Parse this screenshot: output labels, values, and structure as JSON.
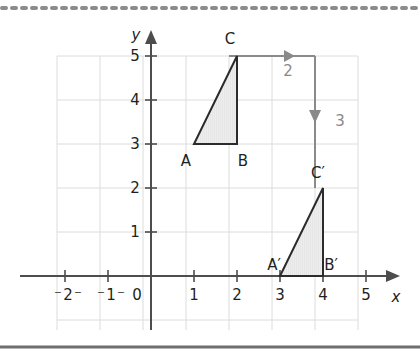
{
  "figure": {
    "background_color": "#ffffff",
    "top_rule": {
      "style": "dotted",
      "color": "#8c8c8c"
    },
    "bottom_rule": {
      "style": "solid",
      "color": "#6e6e6e"
    }
  },
  "axes": {
    "x_label": "x",
    "y_label": "y",
    "origin_label": "0",
    "x_ticks": [
      {
        "value": -2,
        "label": "2",
        "negative": true
      },
      {
        "value": -1,
        "label": "1",
        "negative": true
      },
      {
        "value": 1,
        "label": "1",
        "negative": false
      },
      {
        "value": 2,
        "label": "2",
        "negative": false
      },
      {
        "value": 3,
        "label": "3",
        "negative": false
      },
      {
        "value": 4,
        "label": "4",
        "negative": false
      },
      {
        "value": 5,
        "label": "5",
        "negative": false
      }
    ],
    "y_ticks": [
      {
        "value": 1,
        "label": "1"
      },
      {
        "value": 2,
        "label": "2"
      },
      {
        "value": 3,
        "label": "3"
      },
      {
        "value": 4,
        "label": "4"
      },
      {
        "value": 5,
        "label": "5"
      }
    ],
    "x_range": [
      -2,
      5
    ],
    "y_range": [
      -1,
      5
    ],
    "grid": true,
    "grid_color": "#d8d8d8",
    "axis_color": "#4d4d4d"
  },
  "shapes": {
    "preimage": {
      "name": "triangle-abc",
      "fill": "#ebebeb",
      "stroke": "#2b2b2b",
      "vertices": [
        {
          "label": "A",
          "x": 1,
          "y": 3
        },
        {
          "label": "B",
          "x": 2,
          "y": 3
        },
        {
          "label": "C",
          "x": 2,
          "y": 5
        }
      ]
    },
    "image": {
      "name": "triangle-a-prime-b-prime-c-prime",
      "fill": "#ebebeb",
      "stroke": "#2b2b2b",
      "vertices": [
        {
          "label": "A′",
          "x": 3,
          "y": 0
        },
        {
          "label": "B′",
          "x": 4,
          "y": 0
        },
        {
          "label": "C′",
          "x": 4,
          "y": 2
        }
      ]
    }
  },
  "translation": {
    "color": "#8a8a8a",
    "steps": [
      {
        "name": "horizontal-right",
        "label": "2",
        "from": {
          "x": 2,
          "y": 5
        },
        "to": {
          "x": 4,
          "y": 5
        },
        "direction": "right"
      },
      {
        "name": "vertical-down",
        "label": "3",
        "from": {
          "x": 4,
          "y": 5
        },
        "to": {
          "x": 4,
          "y": 2
        },
        "direction": "down"
      }
    ]
  }
}
